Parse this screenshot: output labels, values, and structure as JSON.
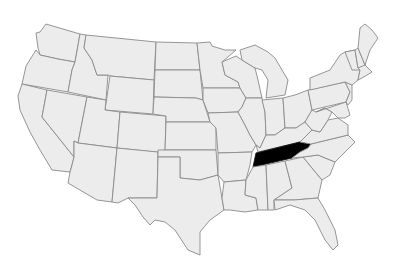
{
  "map": {
    "title": "United States",
    "highlighted_state": "Tennessee",
    "colors": {
      "land": "#ececec",
      "border": "#8a8a8a",
      "highlight": "#000000",
      "background": "#ffffff"
    }
  }
}
